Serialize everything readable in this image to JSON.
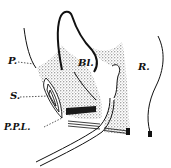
{
  "figure": {
    "type": "anatomical-sectional-diagram",
    "background": "#ffffff",
    "ink": "#111111",
    "labels": [
      {
        "id": "P",
        "text": "P."
      },
      {
        "id": "Bl",
        "text": "Bl."
      },
      {
        "id": "R",
        "text": "R."
      },
      {
        "id": "S",
        "text": "S."
      },
      {
        "id": "PPL",
        "text": "P.P.L."
      }
    ]
  }
}
